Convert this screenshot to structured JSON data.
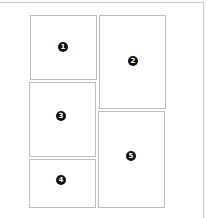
{
  "diagram": {
    "title": "",
    "frame_color": "#c9c9c9",
    "border_color": "#bdbdbd",
    "badge_color": "#111111",
    "panels": [
      {
        "id": 1,
        "label": "1",
        "x": 30,
        "y": 15,
        "w": 67,
        "h": 65,
        "badge_x": 62,
        "badge_y": 47
      },
      {
        "id": 2,
        "label": "2",
        "x": 99,
        "y": 15,
        "w": 67,
        "h": 94,
        "badge_x": 133,
        "badge_y": 61
      },
      {
        "id": 3,
        "label": "3",
        "x": 29,
        "y": 82,
        "w": 67,
        "h": 75,
        "badge_x": 61,
        "badge_y": 116
      },
      {
        "id": 4,
        "label": "4",
        "x": 29,
        "y": 159,
        "w": 67,
        "h": 49,
        "badge_x": 61,
        "badge_y": 180
      },
      {
        "id": 5,
        "label": "5",
        "x": 98,
        "y": 111,
        "w": 67,
        "h": 97,
        "badge_x": 131,
        "badge_y": 156
      }
    ]
  }
}
